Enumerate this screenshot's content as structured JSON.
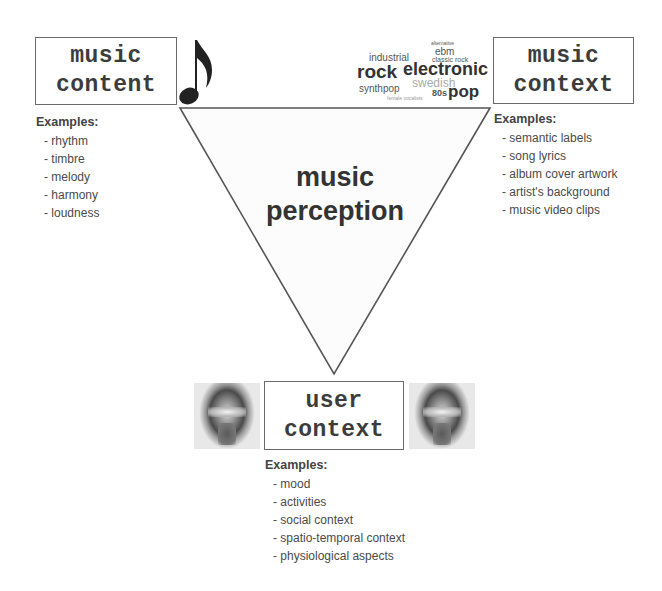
{
  "diagram": {
    "center_label": [
      "music",
      "perception"
    ],
    "music_content": {
      "title_lines": [
        "music",
        "content"
      ],
      "examples_title": "Examples:",
      "examples": [
        "rhythm",
        "timbre",
        "melody",
        "harmony",
        "loudness"
      ],
      "icon": "music-note-icon"
    },
    "music_context": {
      "title_lines": [
        "music",
        "context"
      ],
      "examples_title": "Examples:",
      "examples": [
        "semantic labels",
        "song lyrics",
        "album cover artwork",
        "artist's background",
        "music video clips"
      ],
      "icon": "tag-cloud"
    },
    "user_context": {
      "title_lines": [
        "user",
        "context"
      ],
      "examples_title": "Examples:",
      "examples": [
        "mood",
        "activities",
        "social context",
        "spatio-temporal context",
        "physiological aspects"
      ],
      "icons": [
        "face-headphones-image",
        "face-headphones-image"
      ]
    },
    "tag_cloud": {
      "tags": [
        "industrial",
        "ebm",
        "alternative",
        "classic rock",
        "rock",
        "electronic",
        "swedish",
        "synthpop",
        "80s",
        "pop",
        "female vocalists"
      ]
    },
    "colors": {
      "line": "#555555",
      "box_border": "#6a6a6a",
      "text": "#3a3a3a"
    }
  }
}
